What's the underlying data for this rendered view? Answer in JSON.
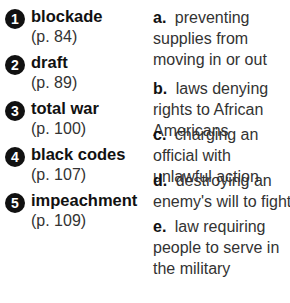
{
  "terms": [
    {
      "number": "1",
      "term": "blockade",
      "page": "(p. 84)"
    },
    {
      "number": "2",
      "term": "draft",
      "page": "(p. 89)"
    },
    {
      "number": "3",
      "term": "total war",
      "page": "(p. 100)"
    },
    {
      "number": "4",
      "term": "black codes",
      "page": "(p. 107)"
    },
    {
      "number": "5",
      "term": "impeachment",
      "page": "(p. 109)"
    }
  ],
  "definitions": [
    {
      "letter": "a.",
      "text": "preventing supplies from moving in or out"
    },
    {
      "letter": "b.",
      "text": "laws denying rights to African Americans"
    },
    {
      "letter": "c.",
      "text": "charging an official with unlawful action"
    },
    {
      "letter": "d.",
      "text": "destroying an enemy's will to fight"
    },
    {
      "letter": "e.",
      "text": "law requiring people to serve in the military"
    }
  ]
}
